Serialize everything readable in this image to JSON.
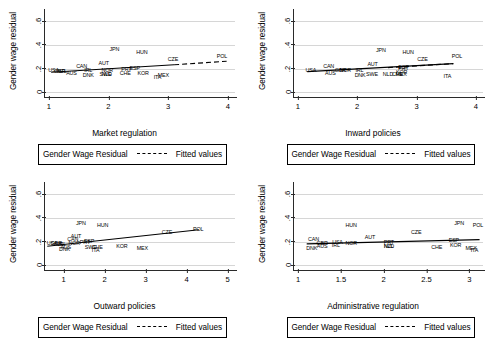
{
  "figure": {
    "type": "scatter-panel-grid",
    "panel_count": 4,
    "legend": {
      "series_label": "Gender Wage Residual",
      "fit_label": "Fitted values",
      "fit_style": "dashed"
    },
    "shared": {
      "ylabel": "Gender wage residual",
      "yticks": [
        "0",
        ".2",
        ".4",
        ".6"
      ],
      "ytick_values": [
        0,
        0.2,
        0.4,
        0.6
      ],
      "ylim": [
        -0.05,
        0.68
      ]
    }
  },
  "chart_data": [
    {
      "type": "scatter",
      "panel": "top-left",
      "title": "",
      "xlabel": "Market regulation",
      "ylabel": "Gender wage residual",
      "xticks": [
        "1",
        "2",
        "3",
        "4"
      ],
      "xtick_values": [
        1,
        2,
        3,
        4
      ],
      "xlim": [
        0.92,
        4.12
      ],
      "ylim": [
        -0.05,
        0.68
      ],
      "yticks": [
        "0",
        ".2",
        ".4",
        ".6"
      ],
      "grid": "horizontal",
      "legend_position": "below",
      "points": [
        {
          "label": "USA",
          "x": 1.08,
          "y": 0.178
        },
        {
          "label": "GBR",
          "x": 1.18,
          "y": 0.172
        },
        {
          "label": "NZL",
          "x": 1.22,
          "y": 0.17
        },
        {
          "label": "AUS",
          "x": 1.38,
          "y": 0.15
        },
        {
          "label": "CAN",
          "x": 1.55,
          "y": 0.215
        },
        {
          "label": "IRL",
          "x": 1.66,
          "y": 0.178
        },
        {
          "label": "DNK",
          "x": 1.66,
          "y": 0.135
        },
        {
          "label": "AUT",
          "x": 1.92,
          "y": 0.235
        },
        {
          "label": "NOR",
          "x": 1.98,
          "y": 0.182
        },
        {
          "label": "SWE",
          "x": 1.95,
          "y": 0.145
        },
        {
          "label": "NLD",
          "x": 1.97,
          "y": 0.145
        },
        {
          "label": "JPN",
          "x": 2.1,
          "y": 0.355
        },
        {
          "label": "PRT",
          "x": 2.3,
          "y": 0.188
        },
        {
          "label": "CHE",
          "x": 2.28,
          "y": 0.15
        },
        {
          "label": "ESP",
          "x": 2.44,
          "y": 0.198
        },
        {
          "label": "HUN",
          "x": 2.56,
          "y": 0.33
        },
        {
          "label": "KOR",
          "x": 2.58,
          "y": 0.152
        },
        {
          "label": "ITA",
          "x": 2.82,
          "y": 0.122
        },
        {
          "label": "MEX",
          "x": 2.92,
          "y": 0.135
        },
        {
          "label": "CZE",
          "x": 3.08,
          "y": 0.272
        },
        {
          "label": "POL",
          "x": 3.9,
          "y": 0.3
        }
      ],
      "fit_solid": {
        "x0": 1.04,
        "y0": 0.168,
        "x1": 3.1,
        "y1": 0.232
      },
      "fit_dashed": {
        "x0": 3.1,
        "y0": 0.232,
        "x1": 3.98,
        "y1": 0.262
      }
    },
    {
      "type": "scatter",
      "panel": "top-right",
      "title": "",
      "xlabel": "Inward policies",
      "ylabel": "Gender wage residual",
      "xticks": [
        "1",
        "2",
        "3",
        "4"
      ],
      "xtick_values": [
        1,
        2,
        3,
        4
      ],
      "xlim": [
        0.92,
        4.12
      ],
      "ylim": [
        -0.05,
        0.68
      ],
      "yticks": [
        "0",
        ".2",
        ".4",
        ".6"
      ],
      "grid": "horizontal",
      "legend_position": "below",
      "points": [
        {
          "label": "USA",
          "x": 1.22,
          "y": 0.18
        },
        {
          "label": "CAN",
          "x": 1.52,
          "y": 0.215
        },
        {
          "label": "AUS",
          "x": 1.55,
          "y": 0.15
        },
        {
          "label": "GBR",
          "x": 1.72,
          "y": 0.182
        },
        {
          "label": "NOR",
          "x": 1.8,
          "y": 0.182
        },
        {
          "label": "IRL",
          "x": 2.04,
          "y": 0.178
        },
        {
          "label": "DNK",
          "x": 2.05,
          "y": 0.138
        },
        {
          "label": "AUT",
          "x": 2.26,
          "y": 0.228
        },
        {
          "label": "SWE",
          "x": 2.25,
          "y": 0.148
        },
        {
          "label": "JPN",
          "x": 2.4,
          "y": 0.352
        },
        {
          "label": "NLD",
          "x": 2.52,
          "y": 0.148
        },
        {
          "label": "CHE",
          "x": 2.68,
          "y": 0.148
        },
        {
          "label": "MEX",
          "x": 2.74,
          "y": 0.142
        },
        {
          "label": "PRT",
          "x": 2.78,
          "y": 0.196
        },
        {
          "label": "ESP",
          "x": 2.78,
          "y": 0.208
        },
        {
          "label": "HUN",
          "x": 2.86,
          "y": 0.33
        },
        {
          "label": "KOR",
          "x": 2.75,
          "y": 0.158
        },
        {
          "label": "CZE",
          "x": 3.1,
          "y": 0.272
        },
        {
          "label": "ITA",
          "x": 3.52,
          "y": 0.13
        },
        {
          "label": "POL",
          "x": 3.68,
          "y": 0.3
        }
      ],
      "fit_solid": {
        "x0": 1.16,
        "y0": 0.174,
        "x1": 3.62,
        "y1": 0.242
      },
      "fit_dashed": {
        "x0": 2.52,
        "y0": 0.208,
        "x1": 3.62,
        "y1": 0.242
      }
    },
    {
      "type": "scatter",
      "panel": "bottom-left",
      "title": "",
      "xlabel": "Outward policies",
      "ylabel": "Gender wage residual",
      "xticks": [
        "1",
        "2",
        "3",
        "4",
        "5"
      ],
      "xtick_values": [
        1,
        2,
        3,
        4,
        5
      ],
      "xlim": [
        0.52,
        5.18
      ],
      "ylim": [
        -0.05,
        0.68
      ],
      "yticks": [
        "0",
        ".2",
        ".4",
        ".6"
      ],
      "grid": "horizontal",
      "legend_position": "below",
      "points": [
        {
          "label": "USA",
          "x": 0.72,
          "y": 0.182
        },
        {
          "label": "GBR",
          "x": 0.82,
          "y": 0.176
        },
        {
          "label": "NZL",
          "x": 0.88,
          "y": 0.172
        },
        {
          "label": "IRL",
          "x": 0.96,
          "y": 0.17
        },
        {
          "label": "DNK",
          "x": 1.02,
          "y": 0.13
        },
        {
          "label": "AUS",
          "x": 1.05,
          "y": 0.146
        },
        {
          "label": "CAN",
          "x": 1.22,
          "y": 0.215
        },
        {
          "label": "NOR",
          "x": 1.26,
          "y": 0.18
        },
        {
          "label": "AUT",
          "x": 1.3,
          "y": 0.238
        },
        {
          "label": "JPN",
          "x": 1.42,
          "y": 0.352
        },
        {
          "label": "PRT",
          "x": 1.52,
          "y": 0.188
        },
        {
          "label": "ESP",
          "x": 1.62,
          "y": 0.2
        },
        {
          "label": "SWE",
          "x": 1.66,
          "y": 0.142
        },
        {
          "label": "CHE",
          "x": 1.82,
          "y": 0.146
        },
        {
          "label": "ITA",
          "x": 1.78,
          "y": 0.122
        },
        {
          "label": "HUN",
          "x": 1.95,
          "y": 0.33
        },
        {
          "label": "KOR",
          "x": 2.42,
          "y": 0.152
        },
        {
          "label": "MEX",
          "x": 2.92,
          "y": 0.14
        },
        {
          "label": "CZE",
          "x": 3.52,
          "y": 0.27
        },
        {
          "label": "POL",
          "x": 4.28,
          "y": 0.302
        }
      ],
      "fit_solid": {
        "x0": 0.6,
        "y0": 0.16,
        "x1": 4.3,
        "y1": 0.3
      },
      "fit_dashed": null
    },
    {
      "type": "scatter",
      "panel": "bottom-right",
      "title": "",
      "xlabel": "Administrative regulation",
      "ylabel": "Gender wage residual",
      "xticks": [
        "1",
        "1.5",
        "2",
        "2.5",
        "3"
      ],
      "xtick_values": [
        1,
        1.5,
        2,
        2.5,
        3
      ],
      "xlim": [
        0.94,
        3.16
      ],
      "ylim": [
        -0.05,
        0.68
      ],
      "yticks": [
        "0",
        ".2",
        ".4",
        ".6"
      ],
      "grid": "horizontal",
      "legend_position": "below",
      "points": [
        {
          "label": "CAN",
          "x": 1.18,
          "y": 0.216
        },
        {
          "label": "DNK",
          "x": 1.16,
          "y": 0.134
        },
        {
          "label": "GBR",
          "x": 1.28,
          "y": 0.18
        },
        {
          "label": "AUS",
          "x": 1.28,
          "y": 0.15
        },
        {
          "label": "USA",
          "x": 1.46,
          "y": 0.186
        },
        {
          "label": "IRL",
          "x": 1.44,
          "y": 0.162
        },
        {
          "label": "NOR",
          "x": 1.62,
          "y": 0.18
        },
        {
          "label": "HUN",
          "x": 1.62,
          "y": 0.33
        },
        {
          "label": "AUT",
          "x": 1.84,
          "y": 0.228
        },
        {
          "label": "PRT",
          "x": 2.06,
          "y": 0.184
        },
        {
          "label": "NLD",
          "x": 2.06,
          "y": 0.15
        },
        {
          "label": "NZL",
          "x": 2.06,
          "y": 0.15
        },
        {
          "label": "CZE",
          "x": 2.38,
          "y": 0.272
        },
        {
          "label": "CHE",
          "x": 2.62,
          "y": 0.146
        },
        {
          "label": "ESP",
          "x": 2.82,
          "y": 0.204
        },
        {
          "label": "KOR",
          "x": 2.84,
          "y": 0.158
        },
        {
          "label": "JPN",
          "x": 2.88,
          "y": 0.352
        },
        {
          "label": "MEX",
          "x": 3.02,
          "y": 0.138
        },
        {
          "label": "ITA",
          "x": 3.06,
          "y": 0.124
        },
        {
          "label": "POL",
          "x": 3.1,
          "y": 0.33
        }
      ],
      "fit_solid": {
        "x0": 1.1,
        "y0": 0.18,
        "x1": 3.12,
        "y1": 0.216
      },
      "fit_dashed": null
    }
  ]
}
